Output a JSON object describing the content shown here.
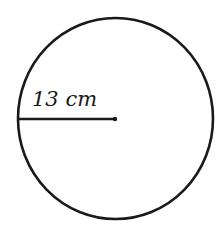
{
  "diagram": {
    "shape": "circle",
    "radius_label": "13 cm",
    "stroke_color": "#1a1a1a",
    "background": "#ffffff"
  }
}
